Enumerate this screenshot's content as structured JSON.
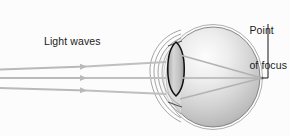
{
  "diagram": {
    "background_color": "#fcfcfc",
    "labels": {
      "light_waves": "Light waves",
      "point_of_focus_line1": "Point",
      "point_of_focus_line2": "of focus"
    },
    "colors": {
      "outline": "#6e6e6e",
      "outline_dark": "#111111",
      "ray": "#b6b6b6",
      "sclera_light": "#fbfbfb",
      "sclera_mid": "#d2d2d2",
      "sclera_dark": "#a8a8a8",
      "lens_fill": "#c9c9c9",
      "leader_line": "#2a2a2a",
      "text": "#1b1b1b"
    },
    "structures": [
      {
        "name": "eyeball-sphere",
        "cx": 213,
        "cy": 77,
        "rx": 48,
        "ry": 51
      },
      {
        "name": "sclera-outer-arc",
        "note": "outer thin outline of eyeball"
      },
      {
        "name": "cornea-arc-1",
        "note": "outermost anterior bulge"
      },
      {
        "name": "cornea-arc-2",
        "note": "middle anterior bulge"
      },
      {
        "name": "cornea-arc-3",
        "note": "inner anterior bulge"
      },
      {
        "name": "lens",
        "note": "biconvex dark outlined lens",
        "x": 174,
        "y_top": 42,
        "y_bottom": 96
      },
      {
        "name": "focus-point",
        "x": 262,
        "y": 78
      }
    ],
    "incoming_rays": [
      {
        "name": "ray-top",
        "x1": 0,
        "y1": 69,
        "x2": 165,
        "y2": 63,
        "arrow_x": 90
      },
      {
        "name": "ray-middle",
        "x1": 0,
        "y1": 78,
        "x2": 165,
        "y2": 78,
        "arrow_x": 90
      },
      {
        "name": "ray-bottom",
        "x1": 0,
        "y1": 88,
        "x2": 165,
        "y2": 93,
        "arrow_x": 90
      }
    ],
    "refracted_rays": [
      {
        "name": "refracted-top",
        "x1": 181,
        "y1": 57,
        "x2": 262,
        "y2": 78
      },
      {
        "name": "refracted-middle",
        "x1": 181,
        "y1": 78,
        "x2": 262,
        "y2": 78
      },
      {
        "name": "refracted-bottom",
        "x1": 181,
        "y1": 97,
        "x2": 262,
        "y2": 78
      }
    ],
    "leader_line": {
      "name": "point-of-focus-leader",
      "x": 268,
      "y1": 24,
      "y2": 78
    }
  }
}
